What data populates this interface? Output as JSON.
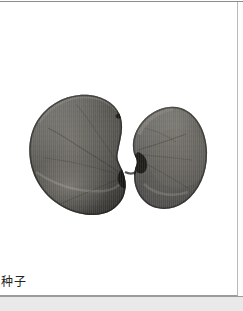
{
  "page": {
    "background_color": "#ffffff",
    "border_color": "#b9b9b9",
    "margin_color": "#e9e9e9"
  },
  "figure": {
    "name": "seed-specimen-photograph",
    "alt_label": "两瓣种子标本照片",
    "parts": [
      {
        "label": "left-cotyledon",
        "shape": "kidney"
      },
      {
        "label": "right-cotyledon",
        "shape": "ovate"
      }
    ],
    "colors": {
      "seed_dark": "#3b3a37",
      "seed_mid": "#565550",
      "seed_light": "#7c7a73",
      "seed_highlight": "#9a978f",
      "seed_shadow": "#1d1c1a",
      "background": "#ffffff"
    }
  },
  "caption": {
    "text": "种子"
  }
}
